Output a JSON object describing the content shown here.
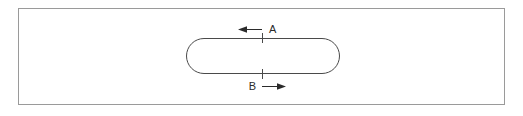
{
  "figure": {
    "background_color": "#ffffff",
    "panel": {
      "name": "outer-plate",
      "border_color": "#9a9a9a",
      "fill_color": "#ffffff",
      "x": 18,
      "y": 8,
      "width": 487,
      "height": 97,
      "stroke_width": 1
    },
    "slot": {
      "name": "rounded-slot",
      "outline_color": "#4a4a4a",
      "fill_color": "#ffffff",
      "x": 186,
      "y": 38,
      "width": 154,
      "height": 36,
      "corner_radius": 18,
      "stroke_width": 1
    },
    "ticks": [
      {
        "name": "tick-top",
        "x": 262,
        "y1": 33,
        "y2": 43,
        "color": "#4a4a4a"
      },
      {
        "name": "tick-bottom",
        "x": 262,
        "y1": 69,
        "y2": 79,
        "color": "#4a4a4a"
      }
    ],
    "callouts": [
      {
        "name": "callout-a",
        "label": "A",
        "arrow_direction": "left",
        "arrow_tail_x": 262,
        "arrow_head_x": 241,
        "arrow_y": 29,
        "label_x": 269,
        "label_y": 29,
        "color": "#2b2b2b"
      },
      {
        "name": "callout-b",
        "label": "B",
        "arrow_direction": "right",
        "arrow_tail_x": 262,
        "arrow_head_x": 283,
        "arrow_y": 87,
        "label_x": 253,
        "label_y": 87,
        "color": "#2b2b2b"
      }
    ]
  }
}
